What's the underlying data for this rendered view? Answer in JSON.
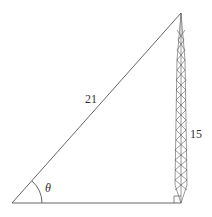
{
  "diagram": {
    "type": "right-triangle-tower",
    "hypotenuse_label": "21",
    "tower_height_label": "15",
    "angle_label": "θ",
    "line_color": "#666666"
  }
}
